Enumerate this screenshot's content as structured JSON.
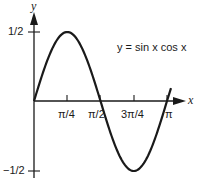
{
  "chart_data": {
    "type": "line",
    "title": "",
    "annotation": "y = sin x cos x",
    "xlabel": "x",
    "ylabel": "y",
    "xlim": [
      0,
      3.3
    ],
    "ylim": [
      -0.5,
      0.5
    ],
    "x_ticks": [
      "π/4",
      "π/2",
      "3π/4",
      "π"
    ],
    "x_tick_values": [
      0.7854,
      1.5708,
      2.3562,
      3.1416
    ],
    "y_ticks": [
      "1/2",
      "−1/2"
    ],
    "y_tick_values": [
      0.5,
      -0.5
    ],
    "grid": false,
    "legend": null,
    "series": [
      {
        "name": "y = sin x cos x",
        "x": [
          0,
          0.3927,
          0.7854,
          1.1781,
          1.5708,
          1.9635,
          2.3562,
          2.7489,
          3.1416
        ],
        "values": [
          0,
          0.3536,
          0.5,
          0.3536,
          0,
          -0.3536,
          -0.5,
          -0.3536,
          0
        ]
      }
    ],
    "color": "#1a1a1a"
  },
  "labels": {
    "y_axis": "y",
    "x_axis": "x",
    "equation": "y = sin x cos x",
    "y_top": "1/2",
    "y_bottom": "−1/2",
    "x_tick_1": "π/4",
    "x_tick_2": "π/2",
    "x_tick_3": "3π/4",
    "x_tick_4": "π"
  }
}
